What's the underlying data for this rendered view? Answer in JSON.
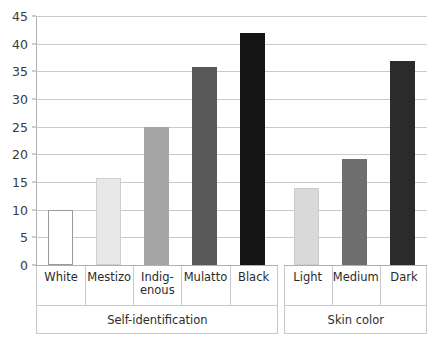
{
  "chart_data": {
    "type": "bar",
    "title": "",
    "subtitle": "",
    "xlabel": "",
    "ylabel": "",
    "ylim": [
      0,
      45
    ],
    "yticks": [
      0,
      5,
      10,
      15,
      20,
      25,
      30,
      35,
      40,
      45
    ],
    "grid": true,
    "legend": "none",
    "categories": [
      "White",
      "Mestizo",
      "Indig-enous",
      "Mulatto",
      "Black",
      "Light",
      "Medium",
      "Dark"
    ],
    "values": [
      10.0,
      15.7,
      25.0,
      35.7,
      42.0,
      14.0,
      19.2,
      36.8
    ],
    "groups": [
      {
        "label": "Self-identification",
        "bars": [
          {
            "label_lines": [
              "White"
            ],
            "value": 10.0,
            "color": "#ffffff",
            "border": "#9a9a9a"
          },
          {
            "label_lines": [
              "Mestizo"
            ],
            "value": 15.7,
            "color": "#e8e8e8",
            "border": "#cfcfcf"
          },
          {
            "label_lines": [
              "Indig-",
              "enous"
            ],
            "value": 25.0,
            "color": "#a6a6a6",
            "border": "#a6a6a6"
          },
          {
            "label_lines": [
              "Mulatto"
            ],
            "value": 35.7,
            "color": "#595959",
            "border": "#595959"
          },
          {
            "label_lines": [
              "Black"
            ],
            "value": 42.0,
            "color": "#141414",
            "border": "#141414"
          }
        ]
      },
      {
        "label": "Skin color",
        "bars": [
          {
            "label_lines": [
              "Light"
            ],
            "value": 14.0,
            "color": "#d9d9d9",
            "border": "#cccccc"
          },
          {
            "label_lines": [
              "Medium"
            ],
            "value": 19.2,
            "color": "#6e6e6e",
            "border": "#6e6e6e"
          },
          {
            "label_lines": [
              "Dark"
            ],
            "value": 36.8,
            "color": "#2b2b2b",
            "border": "#2b2b2b"
          }
        ]
      }
    ]
  },
  "axis": {
    "tick_labels": [
      "0",
      "5",
      "10",
      "15",
      "20",
      "25",
      "30",
      "35",
      "40",
      "45"
    ]
  },
  "colors": {
    "gridline": "#c9c9c9",
    "axis": "#b0b0b0",
    "text": "#2b2b2b",
    "background": "#ffffff"
  }
}
